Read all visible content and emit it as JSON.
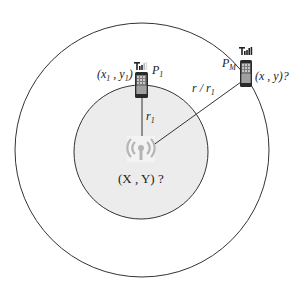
{
  "diagram": {
    "colors": {
      "outer_circle_stroke": "#333333",
      "inner_circle_fill": "#ececec",
      "inner_circle_stroke": "#333333",
      "line": "#333333",
      "phone_body": "#2a2a2a",
      "ap_icon": "#b5b5b5"
    },
    "outer_circle": {
      "cx": 142,
      "cy": 150,
      "r": 127
    },
    "inner_circle": {
      "cx": 141,
      "cy": 152,
      "r": 67
    },
    "access_point": {
      "icon": "wifi-antenna-icon",
      "x": 141,
      "y": 148,
      "label": "(X , Y) ?"
    },
    "devices": [
      {
        "id": "P1",
        "icon": "smartphone-icon",
        "signal_icon": "signal-bars-icon",
        "x": 142,
        "y": 85,
        "name_label": "P",
        "name_sub": "1",
        "coord_label_open": "(x",
        "coord_sub1": "1",
        "coord_label_mid": " , y",
        "coord_sub2": "1",
        "coord_label_close": ")"
      },
      {
        "id": "PM",
        "icon": "smartphone-icon",
        "signal_icon": "signal-bars-icon",
        "x": 246,
        "y": 73,
        "name_label": "P",
        "name_sub": "M",
        "coord_label": "(x , y)?"
      }
    ],
    "edges": [
      {
        "from": "access_point",
        "to": "P1",
        "label": "r",
        "label_sub": "1"
      },
      {
        "from": "access_point",
        "to": "PM",
        "label_pre": "r / r",
        "label_sub": "1"
      }
    ]
  }
}
